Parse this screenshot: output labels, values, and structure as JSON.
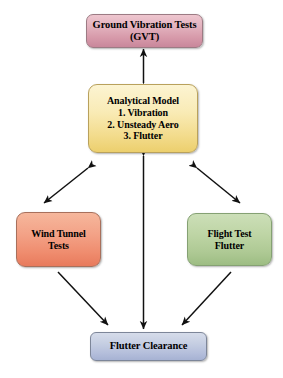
{
  "diagram": {
    "background_color": "#ffffff",
    "width": 283,
    "height": 378,
    "nodes": [
      {
        "id": "gvt",
        "label": "Ground Vibration Tests\n(GVT)",
        "color": "#d79aaa",
        "shape": "rounded-rectangle"
      },
      {
        "id": "analytical",
        "label": "Analytical Model\n1. Vibration\n2. Unsteady Aero\n3. Flutter",
        "color": "#f3dc8d",
        "shape": "rounded-rectangle"
      },
      {
        "id": "wind",
        "label": "Wind Tunnel\nTests",
        "color": "#ef8c6e",
        "shape": "rounded-rectangle"
      },
      {
        "id": "flight",
        "label": "Flight Test\nFlutter",
        "color": "#aec994",
        "shape": "rounded-rectangle"
      },
      {
        "id": "clearance",
        "label": "Flutter Clearance",
        "color": "#b4bedb",
        "shape": "rounded-rectangle"
      }
    ],
    "connectors": [
      {
        "id": "gvt-analytical",
        "from": "analytical",
        "to": "gvt",
        "style": "double-headed-vertical",
        "color": "#1a1a1a"
      },
      {
        "id": "analytical-wind",
        "from": "analytical",
        "to": "wind",
        "style": "double-headed-diagonal",
        "color": "#1a1a1a"
      },
      {
        "id": "analytical-flight",
        "from": "analytical",
        "to": "flight",
        "style": "double-headed-diagonal",
        "color": "#1a1a1a"
      },
      {
        "id": "analytical-clearance",
        "from": "analytical",
        "to": "clearance",
        "style": "double-headed-vertical",
        "color": "#1a1a1a"
      },
      {
        "id": "wind-clearance",
        "from": "wind",
        "to": "clearance",
        "style": "single-headed-diagonal",
        "color": "#1a1a1a"
      },
      {
        "id": "flight-clearance",
        "from": "flight",
        "to": "clearance",
        "style": "single-headed-diagonal",
        "color": "#1a1a1a"
      }
    ]
  }
}
